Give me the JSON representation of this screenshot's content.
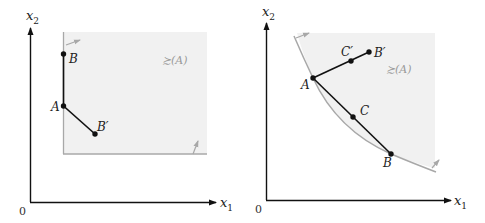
{
  "figure": {
    "left_panel": {
      "name": "Lexicographic-like (Leontief corner) preferences",
      "axis_x_label": "x",
      "axis_x_sub": "1",
      "axis_y_label": "x",
      "axis_y_sub": "2",
      "origin_label": "0",
      "region_label": "≿(A)",
      "points": [
        {
          "id": "B",
          "label": "B"
        },
        {
          "id": "A",
          "label": "A"
        },
        {
          "id": "Bp",
          "label": "B′"
        }
      ]
    },
    "right_panel": {
      "name": "Convex preferences",
      "axis_x_label": "x",
      "axis_x_sub": "1",
      "axis_y_label": "x",
      "axis_y_sub": "2",
      "origin_label": "0",
      "region_label": "≿(A)",
      "points": [
        {
          "id": "A",
          "label": "A"
        },
        {
          "id": "Cp",
          "label": "C′"
        },
        {
          "id": "Bp",
          "label": "B′"
        },
        {
          "id": "C",
          "label": "C"
        },
        {
          "id": "B",
          "label": "B"
        }
      ]
    },
    "colors": {
      "region_fill": "#f1f1f1",
      "boundary": "#a8a8a8",
      "axis": "#111111",
      "segment": "#111111",
      "label_muted": "#9a9a9a"
    }
  }
}
